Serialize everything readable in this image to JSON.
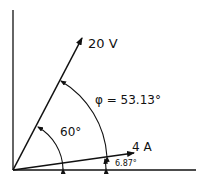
{
  "diagram": {
    "type": "phasor-diagram",
    "colors": {
      "ink": "#111111",
      "background": "#ffffff"
    },
    "axes": {
      "horizontal": "reference axis",
      "vertical": "reference axis"
    },
    "phasors": [
      {
        "name": "voltage",
        "label": "20 V",
        "magnitude": 20,
        "unit": "V",
        "angle_deg": 60
      },
      {
        "name": "current",
        "label": "4 A",
        "magnitude": 4,
        "unit": "A",
        "angle_deg": 6.87
      }
    ],
    "angles": [
      {
        "name": "voltage-angle",
        "label": "60°",
        "value_deg": 60
      },
      {
        "name": "phase-angle",
        "label": "φ = 53.13°",
        "value_deg": 53.13
      },
      {
        "name": "current-angle",
        "label": "6.87°",
        "value_deg": 6.87
      }
    ]
  }
}
